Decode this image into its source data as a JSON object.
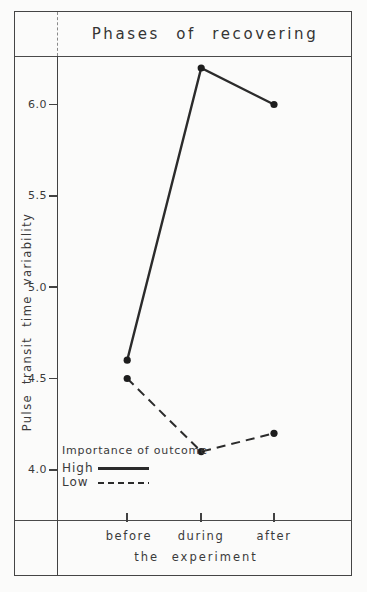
{
  "figure": {
    "title": "Phases of recovering"
  },
  "chart_data": {
    "type": "line",
    "title": "Phases of recovering",
    "categories": [
      "before",
      "during",
      "after"
    ],
    "series": [
      {
        "name": "High",
        "style": "solid",
        "values": [
          4.6,
          6.2,
          6.0
        ]
      },
      {
        "name": "Low",
        "style": "dashed",
        "values": [
          4.5,
          4.1,
          4.2
        ]
      }
    ],
    "xlabel": "the experiment",
    "ylabel": "Pulse transit time variability",
    "y_ticks": [
      4.0,
      4.5,
      5.0,
      5.5,
      6.0
    ],
    "y_tick_labels": [
      "4.0",
      "4.5",
      "5.0",
      "5.5",
      "6.0"
    ],
    "ylim": [
      3.72,
      6.26
    ],
    "x_fractions": [
      0.237,
      0.487,
      0.733
    ],
    "grid": false,
    "legend": {
      "title": "Importance of outcome",
      "position": "lower-left"
    },
    "line_color": "#2b2b2b",
    "point_color": "#1d1d1d"
  }
}
